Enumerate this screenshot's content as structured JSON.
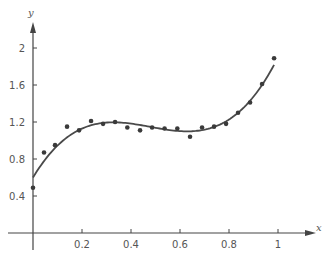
{
  "chart_data": {
    "type": "scatter",
    "title": "",
    "xlabel": "x",
    "ylabel": "y",
    "xlim": [
      -0.1,
      1.2
    ],
    "ylim": [
      -0.3,
      2.35
    ],
    "grid": false,
    "legend": null,
    "x_ticks": [
      0.2,
      0.4,
      0.6,
      0.8,
      1
    ],
    "x_tick_labels": [
      "0.2",
      "0.4",
      "0.6",
      "0.8",
      "1"
    ],
    "y_ticks": [
      0.4,
      0.8,
      1.2,
      1.6,
      2
    ],
    "y_tick_labels": [
      "0.4",
      "0.8",
      "1.2",
      "1.6",
      "2"
    ],
    "series": [
      {
        "name": "data points",
        "type": "scatter",
        "x": [
          0.0,
          0.045,
          0.09,
          0.139,
          0.188,
          0.237,
          0.286,
          0.335,
          0.385,
          0.437,
          0.486,
          0.537,
          0.589,
          0.641,
          0.69,
          0.739,
          0.788,
          0.837,
          0.886,
          0.935,
          0.984
        ],
        "y": [
          0.49,
          0.87,
          0.95,
          1.15,
          1.11,
          1.21,
          1.18,
          1.2,
          1.14,
          1.11,
          1.14,
          1.13,
          1.13,
          1.04,
          1.14,
          1.15,
          1.18,
          1.3,
          1.41,
          1.61,
          1.89
        ]
      },
      {
        "name": "fitted cubic curve",
        "type": "line",
        "coefficients": [
          0.6,
          4.4,
          -10.2,
          7.1
        ],
        "x_range": [
          0,
          0.984
        ]
      }
    ],
    "colors": {
      "axis": "#444444",
      "curve": "#4a4a4a",
      "points": "#3a3a3a",
      "text": "#555555"
    }
  }
}
